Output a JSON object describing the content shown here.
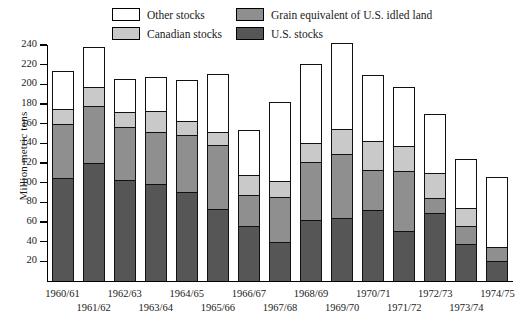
{
  "chart_data": {
    "type": "bar",
    "stacked": true,
    "title": "",
    "xlabel": "",
    "ylabel": "Million metric tons",
    "ylim": [
      0,
      240
    ],
    "ytick_step": 20,
    "yticks": [
      20,
      40,
      60,
      80,
      100,
      120,
      140,
      160,
      180,
      200,
      220,
      240
    ],
    "grid": false,
    "legend_position": "top-center",
    "categories": [
      "1960/61",
      "1961/62",
      "1962/63",
      "1963/64",
      "1964/65",
      "1965/66",
      "1966/67",
      "1967/68",
      "1968/69",
      "1969/70",
      "1970/71",
      "1971/72",
      "1972/73",
      "1973/74",
      "1974/75"
    ],
    "series": [
      {
        "name": "U.S. stocks",
        "color": "#565656",
        "values": [
          104,
          119,
          102,
          98,
          89,
          72,
          55,
          39,
          61,
          63,
          71,
          50,
          68,
          37,
          19
        ]
      },
      {
        "name": "Grain equivalent of U.S. idled land",
        "color": "#8f8f8f",
        "values": [
          55,
          58,
          54,
          53,
          58,
          65,
          31,
          45,
          59,
          65,
          41,
          61,
          15,
          18,
          15
        ]
      },
      {
        "name": "Canadian stocks",
        "color": "#c9c9c9",
        "values": [
          15,
          19,
          15,
          21,
          15,
          14,
          21,
          17,
          19,
          26,
          29,
          25,
          26,
          18,
          0
        ]
      },
      {
        "name": "Other stocks",
        "color": "#ffffff",
        "values": [
          40,
          42,
          34,
          35,
          42,
          60,
          47,
          81,
          82,
          88,
          69,
          61,
          61,
          51,
          72
        ]
      }
    ],
    "totals": [
      214,
      238,
      205,
      207,
      204,
      211,
      154,
      182,
      221,
      242,
      210,
      197,
      170,
      124,
      106
    ]
  },
  "legend": {
    "items": [
      {
        "label": "Other stocks",
        "swatch": "swatch-other-stocks"
      },
      {
        "label": "Canadian stocks",
        "swatch": "swatch-canadian-stocks"
      },
      {
        "label": "Grain equivalent of U.S. idled land",
        "swatch": "swatch-idled-land"
      },
      {
        "label": "U.S. stocks",
        "swatch": "swatch-us-stocks"
      }
    ]
  }
}
